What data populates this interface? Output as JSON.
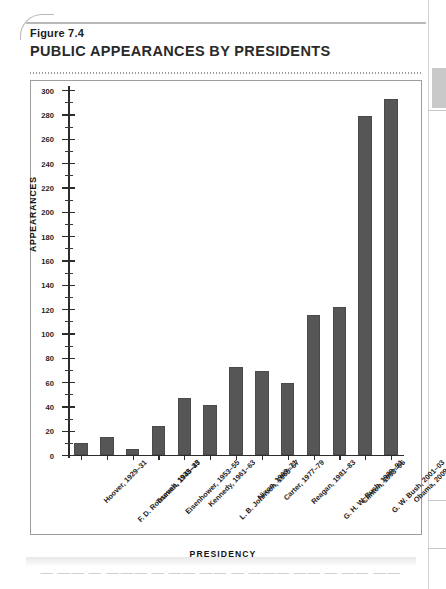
{
  "figure": {
    "number": "Figure 7.4",
    "title": "PUBLIC APPEARANCES BY PRESIDENTS"
  },
  "chart_data": {
    "type": "bar",
    "title": "PUBLIC APPEARANCES BY PRESIDENTS",
    "xlabel": "PRESIDENCY",
    "ylabel": "APPEARANCES",
    "ylim": [
      0,
      300
    ],
    "ytick_step": 20,
    "yminor_step": 10,
    "grid": false,
    "legend": null,
    "categories": [
      "Hoover, 1929–31",
      "F. D. Roosevelt, 1933–35",
      "Truman, 1945–47",
      "Eisenhower, 1953–55",
      "Kennedy, 1961–63",
      "L. B. Johnson, 1965–67",
      "Nixon, 1969–71",
      "Carter, 1977–79",
      "Reagan, 1981–83",
      "G. H. W. Bush, 1989–91",
      "Clinton, 1993–95",
      "G. W. Bush, 2001–03",
      "Obama, 2009–11"
    ],
    "values": [
      10,
      15,
      5,
      24,
      47,
      41,
      72,
      69,
      59,
      115,
      122,
      279,
      293
    ],
    "ytick_labels": [
      "0",
      "20",
      "40",
      "60",
      "80",
      "100",
      "120",
      "140",
      "160",
      "180",
      "200",
      "220",
      "240",
      "260",
      "280",
      "300"
    ],
    "bar_color": "#565656",
    "axis_color": "#2c2c2c"
  }
}
